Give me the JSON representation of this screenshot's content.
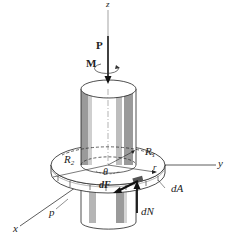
{
  "figure": {
    "type": "engineering free-body diagram",
    "axes": {
      "z": "z",
      "y": "y",
      "x": "x"
    },
    "loads": {
      "force": "P",
      "moment": "M"
    },
    "labels": {
      "outer_radius": "R",
      "outer_radius_sub": "2",
      "inner_radius": "R",
      "inner_radius_sub": "1",
      "angle": "θ",
      "radius_r": "r",
      "friction_force": "dF",
      "normal_force": "dN",
      "area_element": "dA",
      "pressure": "p"
    },
    "colors": {
      "line": "#222222",
      "shade_dark": "#9a9a9a",
      "shade_light": "#cfcfcf",
      "background": "#ffffff"
    }
  }
}
